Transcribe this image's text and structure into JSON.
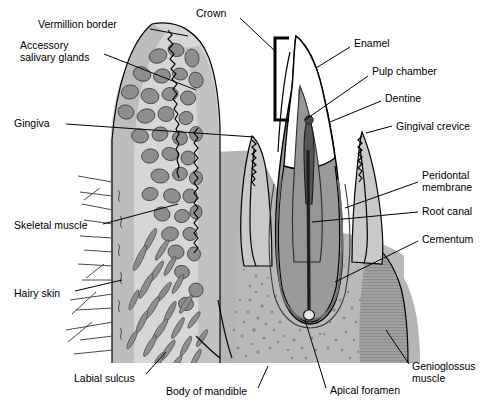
{
  "figure": {
    "width": 486,
    "height": 404,
    "background": "#ffffff"
  },
  "palette": {
    "outline": "#000000",
    "enamel": "#ffffff",
    "dentine": "#9a9a9a",
    "pulp": "#565656",
    "gingiva": "#c9c9c9",
    "lip_tissue": "#d6d6d6",
    "gland": "#8e8e8e",
    "bone": "#b5b5b5",
    "bone_stipple": "#8c8c8c",
    "muscle": "#a2a2a2",
    "skin": "#bdbdbd",
    "label_text": "#000000"
  },
  "labels": [
    {
      "id": "vermillion-border",
      "text": "Vermillion border",
      "x": 38,
      "y": 25,
      "anchor": "start"
    },
    {
      "id": "accessory-salivary-glands-l1",
      "text": "Accessory",
      "x": 20,
      "y": 46,
      "anchor": "start"
    },
    {
      "id": "accessory-salivary-glands-l2",
      "text": "salivary glands",
      "x": 20,
      "y": 58,
      "anchor": "start"
    },
    {
      "id": "gingiva",
      "text": "Gingiva",
      "x": 14,
      "y": 124,
      "anchor": "start"
    },
    {
      "id": "skeletal-muscle",
      "text": "Skeletal muscle",
      "x": 14,
      "y": 226,
      "anchor": "start"
    },
    {
      "id": "hairy-skin",
      "text": "Hairy skin",
      "x": 14,
      "y": 294,
      "anchor": "start"
    },
    {
      "id": "labial-sulcus",
      "text": "Labial sulcus",
      "x": 74,
      "y": 379,
      "anchor": "start"
    },
    {
      "id": "body-of-mandible",
      "text": "Body of mandible",
      "x": 166,
      "y": 392,
      "anchor": "start"
    },
    {
      "id": "crown",
      "text": "Crown",
      "x": 196,
      "y": 14,
      "anchor": "start"
    },
    {
      "id": "enamel",
      "text": "Enamel",
      "x": 354,
      "y": 44,
      "anchor": "start"
    },
    {
      "id": "pulp-chamber",
      "text": "Pulp chamber",
      "x": 372,
      "y": 72,
      "anchor": "start"
    },
    {
      "id": "dentine",
      "text": "Dentine",
      "x": 385,
      "y": 99,
      "anchor": "start"
    },
    {
      "id": "gingival-crevice",
      "text": "Gingival crevice",
      "x": 396,
      "y": 127,
      "anchor": "start"
    },
    {
      "id": "peridontal-membrane-l1",
      "text": "Peridontal",
      "x": 422,
      "y": 176,
      "anchor": "start"
    },
    {
      "id": "peridontal-membrane-l2",
      "text": "membrane",
      "x": 422,
      "y": 188,
      "anchor": "start"
    },
    {
      "id": "root-canal",
      "text": "Root canal",
      "x": 422,
      "y": 212,
      "anchor": "start"
    },
    {
      "id": "cementum",
      "text": "Cementum",
      "x": 422,
      "y": 240,
      "anchor": "start"
    },
    {
      "id": "genioglossus-muscle-l1",
      "text": "Genioglossus",
      "x": 412,
      "y": 367,
      "anchor": "start"
    },
    {
      "id": "genioglossus-muscle-l2",
      "text": "muscle",
      "x": 412,
      "y": 379,
      "anchor": "start"
    },
    {
      "id": "apical-foramen",
      "text": "Apical foramen",
      "x": 330,
      "y": 391,
      "anchor": "start"
    }
  ],
  "leaders": [
    {
      "id": "leader-vermillion-border",
      "points": "150,29 188,36"
    },
    {
      "id": "leader-accessory-salivary-glands",
      "points": "104,54 196,90"
    },
    {
      "id": "leader-gingiva",
      "points": "66,124 254,137"
    },
    {
      "id": "leader-skeletal-muscle",
      "points": "103,224 178,204"
    },
    {
      "id": "leader-hairy-skin",
      "points": "75,291 122,280"
    },
    {
      "id": "leader-labial-sulcus",
      "points": "146,374 166,352"
    },
    {
      "id": "leader-body-of-mandible",
      "points": "258,388 268,366"
    },
    {
      "id": "leader-crown",
      "points": "240,18 276,52"
    },
    {
      "id": "leader-enamel",
      "points": "350,47 316,68"
    },
    {
      "id": "leader-pulp-chamber",
      "points": "368,76 305,120"
    },
    {
      "id": "leader-dentine",
      "points": "381,101 330,122"
    },
    {
      "id": "leader-gingival-crevice",
      "points": "392,126 366,133"
    },
    {
      "id": "leader-peridontal-membrane",
      "points": "418,182 345,208"
    },
    {
      "id": "leader-root-canal",
      "points": "418,212 312,222"
    },
    {
      "id": "leader-cementum",
      "points": "418,241 335,282"
    },
    {
      "id": "leader-genioglossus-muscle",
      "points": "409,364 386,330"
    },
    {
      "id": "leader-apical-foramen",
      "points": "326,388 305,320"
    }
  ],
  "structures": [
    {
      "id": "lip",
      "name": "lower lip cross-section"
    },
    {
      "id": "enamel-cap",
      "name": "enamel"
    },
    {
      "id": "dentine-body",
      "name": "dentine"
    },
    {
      "id": "pulp-chamber-shape",
      "name": "pulp chamber"
    },
    {
      "id": "root-canal-line",
      "name": "root canal"
    },
    {
      "id": "apical-foramen-dot",
      "name": "apical foramen"
    },
    {
      "id": "gingiva-left",
      "name": "gingiva left papilla"
    },
    {
      "id": "gingiva-right",
      "name": "gingiva right papilla"
    },
    {
      "id": "mandible-bone",
      "name": "body of mandible"
    },
    {
      "id": "genioglossus",
      "name": "genioglossus muscle"
    },
    {
      "id": "labial-sulcus-fold",
      "name": "labial sulcus"
    }
  ]
}
